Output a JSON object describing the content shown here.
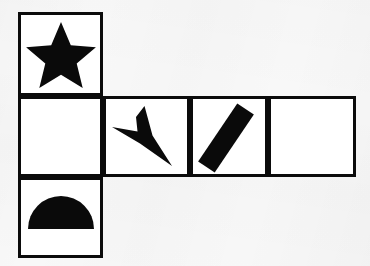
{
  "figure": {
    "background_color": "#f8f8f8",
    "cell_fill_color": "#ffffff",
    "border_color": "#0b0b0b",
    "shape_color": "#0a0a0a",
    "border_width_px": 3,
    "rows": 3,
    "grid_origin": {
      "x": 18,
      "y": 12
    },
    "cell_width_px": 85,
    "cell_height_px": 82
  },
  "rows": [
    {
      "row_index": 0,
      "label": "top-row",
      "y": 12,
      "height": 84,
      "cells": [
        {
          "index": 0,
          "x": 18,
          "width": 85,
          "shape": "star",
          "shape_label": "five-pointed-star",
          "points": 5,
          "filled": true
        }
      ]
    },
    {
      "row_index": 1,
      "label": "middle-row",
      "y": 96,
      "height": 81,
      "cells": [
        {
          "index": 0,
          "x": 18,
          "width": 85,
          "shape": "none",
          "shape_label": "empty",
          "filled": false
        },
        {
          "index": 1,
          "x": 103,
          "width": 87,
          "shape": "arrow",
          "shape_label": "down-right-dart-arrow",
          "direction": "down-right",
          "filled": true
        },
        {
          "index": 2,
          "x": 190,
          "width": 78,
          "shape": "bar",
          "shape_label": "diagonal-thick-bar",
          "rotation_deg": -45,
          "filled": true
        },
        {
          "index": 3,
          "x": 268,
          "width": 88,
          "shape": "none",
          "shape_label": "empty",
          "filled": false
        }
      ]
    },
    {
      "row_index": 2,
      "label": "bottom-row",
      "y": 177,
      "height": 81,
      "cells": [
        {
          "index": 0,
          "x": 18,
          "width": 85,
          "shape": "semicircle",
          "shape_label": "half-disc-flat-bottom",
          "orientation": "flat-side-down",
          "filled": true
        }
      ]
    }
  ]
}
